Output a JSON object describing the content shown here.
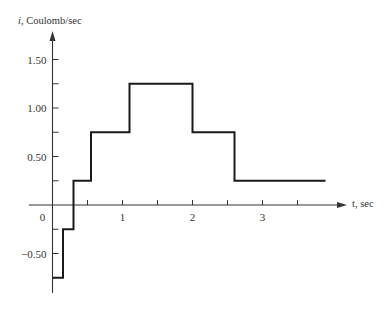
{
  "chart_data": {
    "type": "line",
    "subtype": "step",
    "title": "",
    "xlabel": "t, sec",
    "ylabel": "i, Coulomb/sec",
    "x_var": "t",
    "x_unit": "sec",
    "y_var": "i",
    "y_unit": "Coulomb/sec",
    "xlim": [
      0,
      4
    ],
    "ylim": [
      -0.9,
      1.75
    ],
    "grid": false,
    "legend": null,
    "x_ticks": [
      0.5,
      1,
      1.5,
      2,
      2.5,
      3,
      3.5
    ],
    "x_tick_labels": [
      {
        "value": 0,
        "label": "0"
      },
      {
        "value": 1,
        "label": "1"
      },
      {
        "value": 2,
        "label": "2"
      },
      {
        "value": 3,
        "label": "3"
      }
    ],
    "y_ticks": [
      -0.5,
      -0.25,
      0.25,
      0.5,
      0.75,
      1.0,
      1.25,
      1.5
    ],
    "y_tick_labels": [
      {
        "value": 1.5,
        "label": "1.50"
      },
      {
        "value": 1.0,
        "label": "1.00"
      },
      {
        "value": 0.5,
        "label": "0.50"
      },
      {
        "value": -0.5,
        "label": "−0.50"
      }
    ],
    "series": [
      {
        "name": "i(t)",
        "step_segments": [
          {
            "t_start": 0.0,
            "t_end": 0.15,
            "i": -0.75
          },
          {
            "t_start": 0.15,
            "t_end": 0.3,
            "i": -0.25
          },
          {
            "t_start": 0.3,
            "t_end": 0.55,
            "i": 0.25
          },
          {
            "t_start": 0.55,
            "t_end": 1.1,
            "i": 0.75
          },
          {
            "t_start": 1.1,
            "t_end": 2.0,
            "i": 1.25
          },
          {
            "t_start": 2.0,
            "t_end": 2.6,
            "i": 0.75
          },
          {
            "t_start": 2.6,
            "t_end": 3.9,
            "i": 0.25
          }
        ],
        "x": [
          0,
          0.15,
          0.15,
          0.3,
          0.3,
          0.55,
          0.55,
          1.1,
          1.1,
          2.0,
          2.0,
          2.6,
          2.6,
          3.9
        ],
        "values": [
          -0.75,
          -0.75,
          -0.25,
          -0.25,
          0.25,
          0.25,
          0.75,
          0.75,
          1.25,
          1.25,
          0.75,
          0.75,
          0.25,
          0.25
        ]
      }
    ]
  },
  "labels": {
    "y_axis_var": "i",
    "y_axis_rest": ", Coulomb/sec",
    "x_axis": "t, sec"
  },
  "colors": {
    "line": "#1a1a1a",
    "axis": "#333333",
    "text": "#333333"
  }
}
